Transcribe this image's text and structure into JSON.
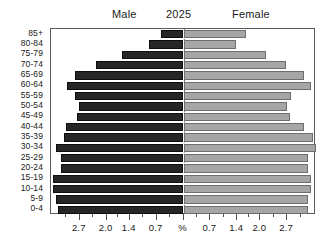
{
  "header": {
    "male_label": "Male",
    "year_label": "2025",
    "female_label": "Female"
  },
  "chart_data": {
    "type": "bar",
    "subtype": "population-pyramid",
    "title": "2025",
    "xlabel": "%",
    "ylabel": "",
    "grid": false,
    "legend_position": "top",
    "categories": [
      "85+",
      "80-84",
      "75-79",
      "70-74",
      "65-69",
      "60-64",
      "55-59",
      "50-54",
      "45-49",
      "40-44",
      "35-39",
      "30-34",
      "25-29",
      "20-24",
      "15-19",
      "10-14",
      "5-9",
      "0-4"
    ],
    "xtick_labels": [
      "2.7",
      "2.0",
      "1.4",
      "0.7",
      "%",
      "0.7",
      "1.4",
      "2.0",
      "2.7"
    ],
    "xtick_values": [
      2.7,
      2.0,
      1.4,
      0.7,
      0.0,
      0.7,
      1.4,
      2.0,
      2.7
    ],
    "xlim": [
      -3.45,
      3.45
    ],
    "series": [
      {
        "name": "Male",
        "side": "left",
        "color": "#262626",
        "values": [
          0.58,
          0.89,
          1.6,
          2.28,
          2.83,
          3.04,
          2.83,
          2.73,
          2.78,
          3.07,
          3.12,
          3.33,
          3.18,
          3.2,
          3.41,
          3.41,
          3.31,
          3.28
        ]
      },
      {
        "name": "Female",
        "side": "right",
        "color": "#a6a6a6",
        "values": [
          1.63,
          1.36,
          2.15,
          2.68,
          3.15,
          3.33,
          2.81,
          2.7,
          2.76,
          3.15,
          3.36,
          3.44,
          3.23,
          3.23,
          3.31,
          3.33,
          3.23,
          3.23
        ]
      }
    ]
  },
  "colors": {
    "male_fill": "#262626",
    "female_fill": "#a6a6a6",
    "frame": "#5a5a5a",
    "center_divider": "#777777",
    "text": "#1a1a1a"
  }
}
